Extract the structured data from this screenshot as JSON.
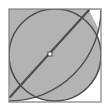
{
  "figure": {
    "title": "Circle inscribed in square with diagonal chord",
    "type": "geometric-diagram",
    "canvas": {
      "width": 108,
      "height": 112,
      "background_color": "#ffffff"
    },
    "colors": {
      "fill_gray": "#b3b3b3",
      "stroke_dark": "#4d4d4d",
      "frame_gray": "#808080",
      "white": "#ffffff",
      "marker_fill": "#ffffff",
      "marker_stroke": "#3a3a3a"
    },
    "square": {
      "label": "bounding-square",
      "x": 9,
      "y": 9,
      "width": 92,
      "height": 93,
      "stroke_width": 1.2,
      "fill": "none"
    },
    "circle": {
      "label": "inscribed-circle",
      "cx": 55,
      "cy": 55,
      "r": 46,
      "stroke_width": 1.6
    },
    "quarter_arc": {
      "label": "quarter-circle-arc",
      "center_x": 9,
      "center_y": 9,
      "radius": 92,
      "description": "quarter circle centered at top-left corner of square"
    },
    "diagonal": {
      "label": "diameter-chord",
      "x1": 10,
      "y1": 97,
      "x2": 89,
      "y2": 10,
      "stroke_width": 2.2
    },
    "center_marker": {
      "label": "midpoint-marker",
      "cx": 50,
      "cy": 54,
      "size": 4,
      "shape": "square"
    },
    "white_wedges": [
      {
        "label": "top-right-wedge",
        "description": "white region bounded by diagonal, circle arc and square corner"
      },
      {
        "label": "bottom-left-wedge",
        "description": "white region bounded by diagonal, circle arc and square corner"
      }
    ]
  }
}
